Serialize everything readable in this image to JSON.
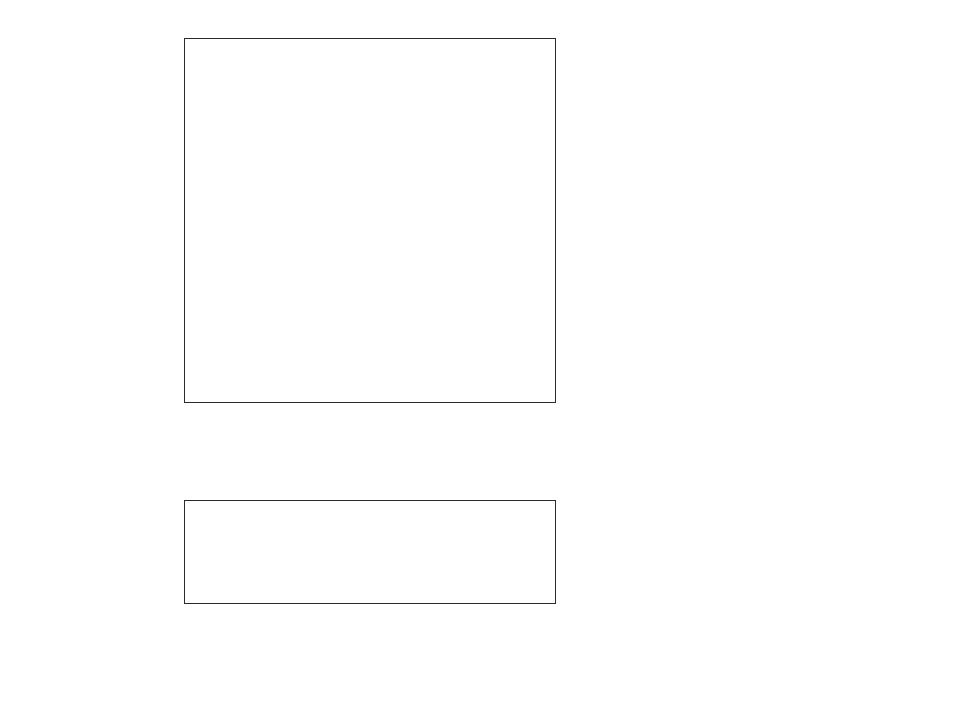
{
  "chart_data": [
    {
      "type": "bar",
      "orientation": "horizontal",
      "title": "",
      "xlabel": "Percentage",
      "ylabel": "",
      "xlim": [
        0,
        100
      ],
      "xticks": [
        0,
        20,
        40,
        60,
        80,
        100
      ],
      "xtick_labels": [
        "0",
        "20",
        "40",
        "60",
        "80",
        "100"
      ],
      "grid": true,
      "legend_position": "right",
      "categories": [
        "Female Labor\nForce",
        "Male Labor\nForce",
        "High School\nGraduate",
        "Female Head\nof Household",
        "Family\nPoverty"
      ],
      "series": [
        {
          "name": "Central/South America\n(includes other Hispanics)",
          "color": "#a8a8a8",
          "values": [
            57,
            81,
            65,
            23,
            21
          ]
        },
        {
          "name": "Puerto-Rican",
          "color": "#161616",
          "values": [
            46,
            48,
            69,
            43,
            35
          ]
        },
        {
          "name": "Cuban",
          "color": "#808080",
          "values": [
            54,
            54,
            66,
            19,
            18
          ]
        },
        {
          "name": "Mexican",
          "color": "#5a5a5a",
          "values": [
            51,
            55,
            47,
            19.5,
            32
          ]
        },
        {
          "name": "All U.S.",
          "color": "#dcdcdc",
          "values": [
            58.5,
            77,
            83,
            11,
            11
          ]
        }
      ]
    },
    {
      "type": "bar",
      "orientation": "horizontal",
      "title": "",
      "xlabel": "Average Household Size",
      "ylabel": "",
      "xlim": [
        0,
        4
      ],
      "xticks": [
        0,
        0.5,
        1,
        1.5,
        2,
        2.5,
        3,
        3.5,
        4
      ],
      "xtick_labels": [
        "0",
        "0.5",
        "1",
        "1.5",
        "2",
        "2.5",
        "3",
        "3.5",
        "4"
      ],
      "grid": true,
      "legend_position": "none",
      "categories": [
        ""
      ],
      "series": [
        {
          "name": "Central/South America\n(includes other Hispanics)",
          "color": "#a8a8a8",
          "values": [
            3.52
          ]
        },
        {
          "name": "Puerto-Rican",
          "color": "#161616",
          "values": [
            2.78
          ]
        },
        {
          "name": "Cuban",
          "color": "#808080",
          "values": [
            2.65
          ]
        },
        {
          "name": "Mexican",
          "color": "#5a5a5a",
          "values": [
            2.32
          ]
        },
        {
          "name": "All U.S.",
          "color": "#dcdcdc",
          "values": [
            2.72
          ]
        }
      ]
    }
  ],
  "legend": {
    "items": [
      {
        "label": "Central/South America\n(includes other Hispanics)",
        "color": "#a8a8a8"
      },
      {
        "label": "Puerto-Rican",
        "color": "#161616"
      },
      {
        "label": "Cuban",
        "color": "#808080"
      },
      {
        "label": "Mexican",
        "color": "#5a5a5a"
      },
      {
        "label": "All U.S.",
        "color": "#dcdcdc"
      }
    ]
  }
}
